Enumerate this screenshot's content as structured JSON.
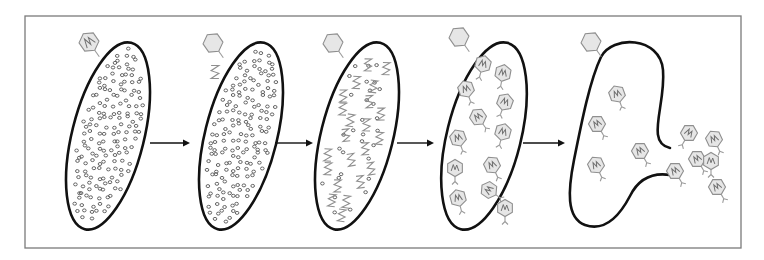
{
  "title": "Bacteriophage lytic cycle",
  "colors": {
    "frame": "#7a7a7a",
    "cell_outline": "#111111",
    "phage_fill": "#e6e6e6",
    "phage_stroke": "#8f8f8f",
    "ribosome": "#555555",
    "arrow": "#111111"
  },
  "frame": {
    "x": 25,
    "y": 16,
    "w": 716,
    "h": 232
  },
  "stages": [
    {
      "id": "attachment",
      "label": "Phage attaches to bacterial cell",
      "cell": {
        "cx": 108,
        "cy": 136,
        "rx": 36,
        "ry": 96,
        "rot": 14
      },
      "attached_phage": {
        "x": 89,
        "y": 42,
        "has_dna": true
      },
      "ribosome_density": "full",
      "internal_dna": 0,
      "internal_phages": 0
    },
    {
      "id": "injection",
      "label": "Phage DNA injected into cell",
      "cell": {
        "cx": 241,
        "cy": 136,
        "rx": 36,
        "ry": 96,
        "rot": 14
      },
      "attached_phage": {
        "x": 213,
        "y": 43,
        "has_dna": false
      },
      "ribosome_density": "full",
      "internal_dna": 1,
      "internal_phages": 0
    },
    {
      "id": "replication",
      "label": "Phage DNA replicated, host DNA degraded",
      "cell": {
        "cx": 357,
        "cy": 136,
        "rx": 36,
        "ry": 96,
        "rot": 14
      },
      "attached_phage": {
        "x": 333,
        "y": 43,
        "has_dna": false
      },
      "ribosome_density": "sparse",
      "internal_dna": 22,
      "internal_phages": 0
    },
    {
      "id": "assembly",
      "label": "New phages assembled",
      "cell": {
        "cx": 484,
        "cy": 136,
        "rx": 37,
        "ry": 96,
        "rot": 14
      },
      "attached_phage": {
        "x": 459,
        "y": 37,
        "has_dna": false
      },
      "ribosome_density": "none",
      "internal_dna": 0,
      "internal_phages": 12
    },
    {
      "id": "lysis",
      "label": "Cell lyses, releasing new phages",
      "cell": {
        "burst": true
      },
      "attached_phage": {
        "x": 591,
        "y": 42,
        "has_dna": false
      },
      "ribosome_density": "none",
      "internal_dna": 0,
      "internal_phages": 5,
      "released_phages": 6
    }
  ],
  "arrows": [
    {
      "x1": 150,
      "x2": 190,
      "y": 143
    },
    {
      "x1": 275,
      "x2": 313,
      "y": 143
    },
    {
      "x1": 397,
      "x2": 434,
      "y": 143
    },
    {
      "x1": 523,
      "x2": 565,
      "y": 143
    }
  ],
  "phages_stage4": [
    [
      483,
      64,
      15,
      "down"
    ],
    [
      503,
      73,
      10,
      "down"
    ],
    [
      466,
      89,
      -20,
      "down"
    ],
    [
      505,
      102,
      20,
      "down"
    ],
    [
      478,
      117,
      -35,
      "down"
    ],
    [
      503,
      132,
      15,
      "down"
    ],
    [
      458,
      138,
      -20,
      "down"
    ],
    [
      492,
      165,
      -25,
      "down"
    ],
    [
      455,
      168,
      0,
      "down"
    ],
    [
      489,
      190,
      -55,
      "down"
    ],
    [
      458,
      198,
      -15,
      "down"
    ],
    [
      505,
      208,
      0,
      "down"
    ]
  ],
  "phages_stage5": [
    [
      617,
      94,
      -20
    ],
    [
      597,
      124,
      -30
    ],
    [
      640,
      151,
      -30
    ],
    [
      596,
      165,
      -25
    ]
  ],
  "phages_released": [
    [
      689,
      133,
      30
    ],
    [
      714,
      139,
      -25
    ],
    [
      697,
      159,
      -30
    ],
    [
      675,
      171,
      -30
    ],
    [
      717,
      187,
      -30
    ],
    [
      711,
      161,
      0
    ]
  ]
}
